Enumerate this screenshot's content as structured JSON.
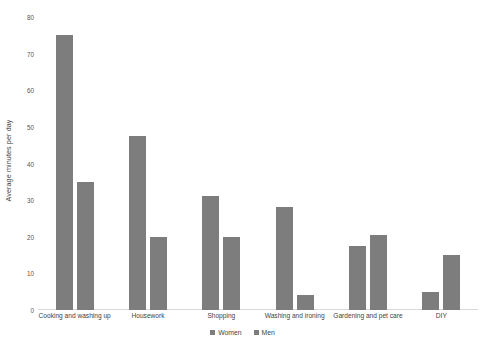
{
  "chart_data": {
    "type": "bar",
    "title": "",
    "subtitle": "",
    "xlabel": "",
    "ylabel": "Average minutes per day",
    "ylim": [
      0,
      80
    ],
    "ytick_step": 10,
    "yticks": [
      "0",
      "10",
      "20",
      "30",
      "40",
      "50",
      "60",
      "70",
      "80"
    ],
    "grid": false,
    "legend_position": "bottom",
    "categories": [
      "Cooking and washing up",
      "Housework",
      "Shopping",
      "Washing and ironing",
      "Gardening and pet care",
      "DIY"
    ],
    "series": [
      {
        "name": "Women",
        "color": "#7d7d7d",
        "values": [
          75,
          47.5,
          31,
          28,
          17.5,
          5
        ]
      },
      {
        "name": "Men",
        "color": "#7d7d7d",
        "values": [
          35,
          20,
          20,
          4,
          20.5,
          15
        ]
      }
    ]
  },
  "legend": {
    "items": [
      {
        "label": "Women",
        "color": "#7d7d7d"
      },
      {
        "label": "Men",
        "color": "#7d7d7d"
      }
    ]
  },
  "colors": {
    "bar": "#7d7d7d",
    "axis": "#d9d9d9",
    "text": "#3f3f3f",
    "background": "#ffffff"
  }
}
